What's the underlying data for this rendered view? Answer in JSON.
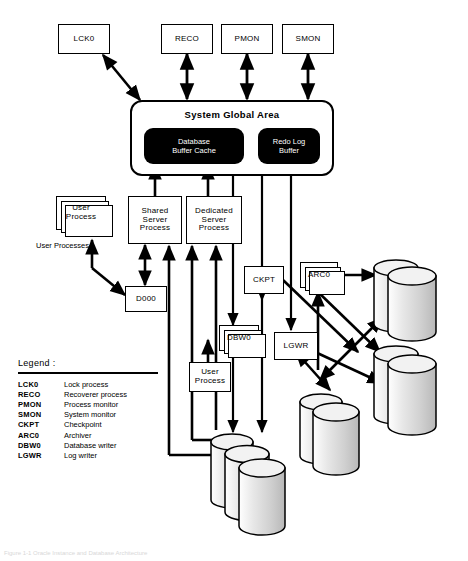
{
  "figure": {
    "caption": "Figure 1-1 Oracle Instance and Database Architecture"
  },
  "background_processes": [
    {
      "id": "lck0",
      "label": "LCK0"
    },
    {
      "id": "reco",
      "label": "RECO"
    },
    {
      "id": "pmon",
      "label": "PMON"
    },
    {
      "id": "smon",
      "label": "SMON"
    }
  ],
  "sga": {
    "title": "System Global Area",
    "buffers": [
      {
        "id": "database-buffer-cache",
        "label": "Database\nBuffer Cache",
        "line1": "Database",
        "line2": "Buffer Cache",
        "color": "#000000"
      },
      {
        "id": "redo-log-buffer",
        "label": "Redo Log\nBuffer",
        "line1": "Redo Log",
        "line2": "Buffer",
        "color": "#000000"
      }
    ]
  },
  "processes": {
    "user_processes_stack": {
      "line1": "User",
      "line2": "Process",
      "caption": "User Processes"
    },
    "shared_server": {
      "line1": "Shared",
      "line2": "Server",
      "line3": "Process"
    },
    "dedicated_server": {
      "line1": "Dedicated",
      "line2": "Server",
      "line3": "Process"
    },
    "dispatcher": {
      "label": "D000"
    },
    "ckpt": {
      "label": "CKPT"
    },
    "dbw0": {
      "label": "DBW0"
    },
    "lgwr": {
      "label": "LGWR"
    },
    "arc0": {
      "label": "ARC0"
    },
    "user_process_single": {
      "line1": "User",
      "line2": "Process"
    }
  },
  "storage": [
    {
      "id": "offline-storage-device",
      "line1": "Offline",
      "line2": "Storage",
      "line3": "Device",
      "count": 2
    },
    {
      "id": "control-files",
      "line1": "Control",
      "line2": "Files",
      "line3": "",
      "count": 2
    },
    {
      "id": "redo-log-files",
      "line1": "Redo Log",
      "line2": "Files",
      "line3": "",
      "count": 2
    },
    {
      "id": "datafiles",
      "line1": "Datafiles",
      "line2": "",
      "line3": "",
      "count": 3
    }
  ],
  "legend": {
    "title": "Legend :",
    "entries": [
      {
        "abbr": "LCK0",
        "desc": "Lock process"
      },
      {
        "abbr": "RECO",
        "desc": "Recoverer process"
      },
      {
        "abbr": "PMON",
        "desc": "Process monitor"
      },
      {
        "abbr": "SMON",
        "desc": "System monitor"
      },
      {
        "abbr": "CKPT",
        "desc": "Checkpoint"
      },
      {
        "abbr": "ARC0",
        "desc": "Archiver"
      },
      {
        "abbr": "DBW0",
        "desc": "Database writer"
      },
      {
        "abbr": "LGWR",
        "desc": "Log writer"
      }
    ]
  },
  "colors": {
    "stroke": "#000000",
    "buffer_fill": "#000000",
    "buffer_text": "#ffffff",
    "cylinder_top": "#f2f2f2",
    "cylinder_body": "#d9d9d9",
    "page_background": "#ffffff"
  }
}
